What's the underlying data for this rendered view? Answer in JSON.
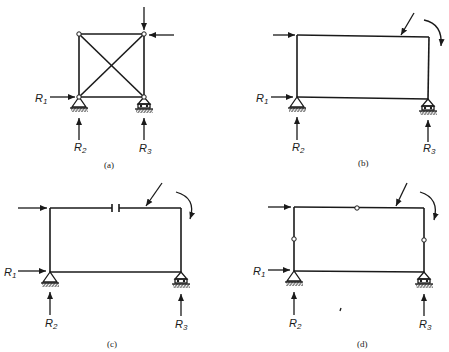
{
  "figure": {
    "colors": {
      "ink": "#1a1a1a",
      "background": "#ffffff"
    },
    "panels": [
      {
        "id": "a",
        "caption": "(a)",
        "type": "braced truss with pinned joints",
        "labels": {
          "r1": "R",
          "r1_sub": "1",
          "r2": "R",
          "r2_sub": "2",
          "r3": "R",
          "r3_sub": "3"
        }
      },
      {
        "id": "b",
        "caption": "(b)",
        "type": "rigid rectangular frame",
        "labels": {
          "r1": "R",
          "r1_sub": "1",
          "r2": "R",
          "r2_sub": "2",
          "r3": "R",
          "r3_sub": "3"
        }
      },
      {
        "id": "c",
        "caption": "(c)",
        "type": "rectangular frame with cut in top member",
        "labels": {
          "r1": "R",
          "r1_sub": "1",
          "r2": "R",
          "r2_sub": "2",
          "r3": "R",
          "r3_sub": "3"
        }
      },
      {
        "id": "d",
        "caption": "(d)",
        "type": "rectangular frame with three internal hinges",
        "labels": {
          "r1": "R",
          "r1_sub": "1",
          "r2": "R",
          "r2_sub": "2",
          "r3": "R",
          "r3_sub": "3"
        }
      }
    ]
  }
}
